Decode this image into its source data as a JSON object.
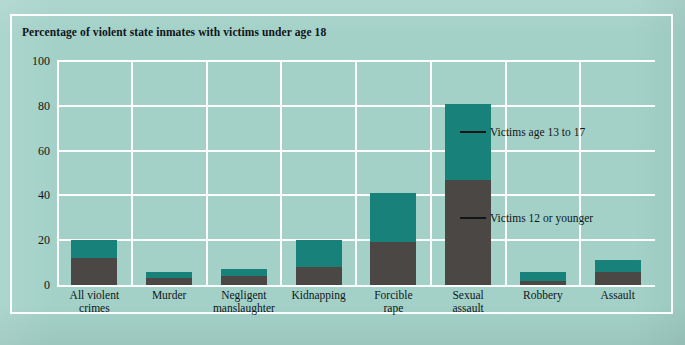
{
  "chart_data": {
    "type": "bar",
    "subtype": "stacked-bar",
    "title": "Percentage of violent state inmates with victims under age 18",
    "xlabel": "",
    "ylabel": "",
    "ylim": [
      0,
      100
    ],
    "yticks": [
      0,
      20,
      40,
      60,
      80,
      100
    ],
    "grid": true,
    "grid_orientation": "both",
    "legend_position": "inline-annotations",
    "categories": [
      "All violent crimes",
      "Murder",
      "Negligent manslaughter",
      "Kidnapping",
      "Forcible rape",
      "Sexual assault",
      "Robbery",
      "Assault"
    ],
    "category_lines": [
      [
        "All violent",
        "crimes"
      ],
      [
        "Murder"
      ],
      [
        "Negligent",
        "manslaughter"
      ],
      [
        "Kidnapping"
      ],
      [
        "Forcible",
        "rape"
      ],
      [
        "Sexual",
        "assault"
      ],
      [
        "Robbery"
      ],
      [
        "Assault"
      ]
    ],
    "series": [
      {
        "name": "Victims 12 or younger",
        "color": "#4a4745",
        "values": [
          12,
          3,
          4,
          8,
          19,
          47,
          2,
          6
        ]
      },
      {
        "name": "Victims age 13 to 17",
        "color": "#17817a",
        "values": [
          8,
          3,
          3,
          12,
          22,
          34,
          4,
          5
        ]
      }
    ],
    "totals": [
      20,
      6,
      7,
      20,
      41,
      81,
      6,
      11
    ],
    "annotations": [
      {
        "text": "Victims age 13 to 17",
        "points_to": "Sexual assault upper segment"
      },
      {
        "text": "Victims 12 or younger",
        "points_to": "Sexual assault lower segment"
      }
    ]
  },
  "colors": {
    "background": "#a3d1c8",
    "grid": "#ffffff",
    "upper_segment": "#17817a",
    "lower_segment": "#4a4745",
    "text": "#11161a"
  }
}
